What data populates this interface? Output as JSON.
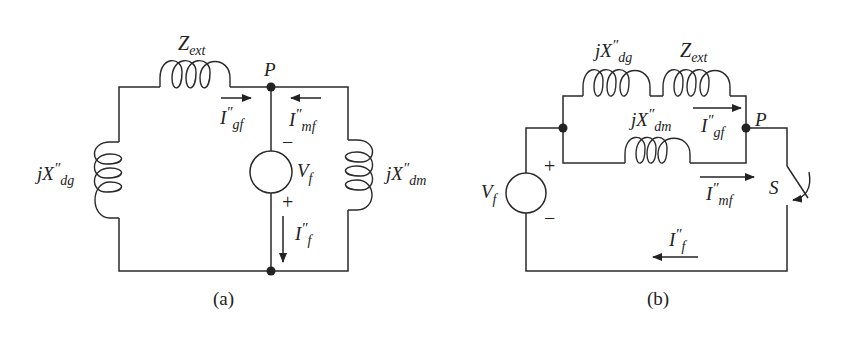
{
  "figure": {
    "panels": [
      {
        "id": "a",
        "caption": "(a)",
        "labels": {
          "z_ext": {
            "main": "Z",
            "sub": "ext"
          },
          "node_p": "P",
          "x_dg": {
            "main": "jX",
            "prime": "″",
            "sub": "dg"
          },
          "x_dm": {
            "main": "jX",
            "prime": "″",
            "sub": "dm"
          },
          "source": {
            "main": "V",
            "sub": "f"
          },
          "i_gf": {
            "main": "I",
            "prime": "″",
            "sub": "gf"
          },
          "i_mf": {
            "main": "I",
            "prime": "″",
            "sub": "mf"
          },
          "i_f": {
            "main": "I",
            "prime": "″",
            "sub": "f"
          },
          "minus": "−",
          "plus": "+"
        }
      },
      {
        "id": "b",
        "caption": "(b)",
        "labels": {
          "x_dg": {
            "main": "jX",
            "prime": "″",
            "sub": "dg"
          },
          "z_ext": {
            "main": "Z",
            "sub": "ext"
          },
          "x_dm": {
            "main": "jX",
            "prime": "″",
            "sub": "dm"
          },
          "node_p": "P",
          "source": {
            "main": "V",
            "sub": "f"
          },
          "i_gf": {
            "main": "I",
            "prime": "″",
            "sub": "gf"
          },
          "i_mf": {
            "main": "I",
            "prime": "″",
            "sub": "mf"
          },
          "i_f": {
            "main": "I",
            "prime": "″",
            "sub": "f"
          },
          "switch": "S",
          "plus": "+",
          "minus": "−"
        }
      }
    ]
  },
  "colors": {
    "stroke": "#2a2a2a",
    "background": "#ffffff"
  }
}
